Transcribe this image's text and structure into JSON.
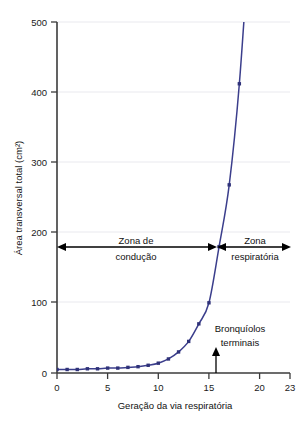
{
  "chart_data": {
    "type": "line",
    "title": "",
    "xlabel": "Geração da via respiratória",
    "ylabel": "Área transversal total (cm²)",
    "xlim": [
      0,
      23
    ],
    "ylim": [
      0,
      500
    ],
    "xticks": [
      0,
      5,
      10,
      15,
      20,
      23
    ],
    "xticklabels": [
      "0",
      "5",
      "10",
      "15",
      "20",
      "23"
    ],
    "yticks": [
      0,
      100,
      200,
      300,
      400,
      500
    ],
    "yticklabels": [
      "0",
      "100",
      "200",
      "300",
      "400",
      "500"
    ],
    "grid": "horizontal-faint",
    "legend": "none",
    "series": [
      {
        "name": "Área transversal total",
        "marker": "square",
        "color": "#3b3e8c",
        "x": [
          0,
          1,
          2,
          3,
          4,
          5,
          6,
          7,
          8,
          9,
          10,
          11,
          12,
          13,
          14,
          15,
          16,
          17,
          18,
          19
        ],
        "y": [
          5,
          5,
          5,
          6,
          6,
          7,
          7,
          8,
          9,
          11,
          14,
          20,
          30,
          45,
          70,
          100,
          180,
          268,
          412,
          620
        ]
      }
    ],
    "annotations": [
      {
        "name": "zona-de-conducao",
        "text_line1": "Zona de",
        "text_line2": "condução",
        "type": "double-arrow",
        "x_start": 0,
        "x_end": 16,
        "y": 180
      },
      {
        "name": "zona-respiratoria",
        "text_line1": "Zona",
        "text_line2": "respiratória",
        "type": "double-arrow",
        "x_start": 16,
        "x_end": 23,
        "y": 180
      },
      {
        "name": "bronquiolos-terminais",
        "text_line1": "Bronquíolos",
        "text_line2": "terminais",
        "type": "up-arrow-pointer",
        "x": 16,
        "y": 0
      }
    ],
    "colors": {
      "curve": "#3b3e8c",
      "marker": "#2f3279",
      "axis": "#3b3b3b",
      "grid": "#e9e9ee",
      "text": "#111111",
      "background": "#ffffff"
    }
  }
}
